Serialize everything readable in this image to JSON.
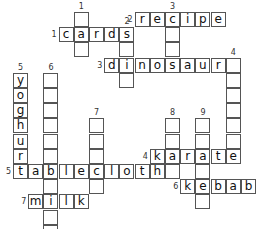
{
  "cell_size": 15.2,
  "origin": {
    "x": 13,
    "y": 12
  },
  "across": [
    {
      "number": "1",
      "answer": "cards",
      "row": 1,
      "col": 3
    },
    {
      "number": "2",
      "answer": "recipe",
      "row": 0,
      "col": 8
    },
    {
      "number": "3",
      "answer": "dinosaur",
      "row": 3,
      "col": 6
    },
    {
      "number": "4",
      "answer": "karate",
      "row": 9,
      "col": 9
    },
    {
      "number": "5",
      "answer": "tablecloth",
      "row": 10,
      "col": 0
    },
    {
      "number": "6",
      "answer": "kebab",
      "row": 11,
      "col": 11
    },
    {
      "number": "7",
      "answer": "milk",
      "row": 12,
      "col": 1
    }
  ],
  "down": [
    {
      "number": "1",
      "length": 3,
      "row": 0,
      "col": 4
    },
    {
      "number": "2",
      "length": 4,
      "row": 1,
      "col": 7
    },
    {
      "number": "3",
      "length": 4,
      "row": 0,
      "col": 10
    },
    {
      "number": "4",
      "length": 7,
      "row": 3,
      "col": 14
    },
    {
      "number": "5",
      "answer": "yoghurt",
      "length": 7,
      "row": 4,
      "col": 0
    },
    {
      "number": "6",
      "length": 11,
      "row": 4,
      "col": 2
    },
    {
      "number": "7",
      "length": 5,
      "row": 7,
      "col": 5
    },
    {
      "number": "8",
      "length": 4,
      "row": 7,
      "col": 10
    },
    {
      "number": "9",
      "length": 6,
      "row": 7,
      "col": 12
    }
  ]
}
